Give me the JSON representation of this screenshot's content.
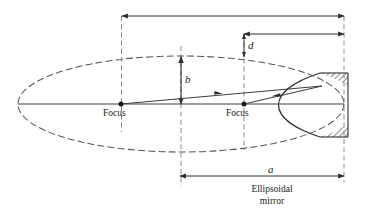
{
  "figure": {
    "type": "ray-diagram",
    "title": "",
    "caption_label": "Ellipsoidal\nmirror",
    "caption_line1": "Ellipsoidal",
    "caption_line2": "mirror",
    "labels": {
      "focus_left": "Focus",
      "focus_right": "Focus",
      "semi_minor": "b",
      "semi_major": "a",
      "distance_d": "d"
    },
    "colors": {
      "line": "#3c3c3c",
      "ellipse_dash": "#555555",
      "mirror_fill": "#b8b8b8",
      "mirror_border": "#333333",
      "text": "#1a1a1a",
      "background": "#ffffff"
    },
    "geometry": {
      "ellipse_center_x": 181,
      "ellipse_center_y": 104,
      "semi_major_px": 163,
      "semi_minor_px": 48,
      "focus_left_x": 121,
      "focus_right_x": 244,
      "axis_y": 104,
      "mirror_rect_x": 320,
      "mirror_rect_y": 73,
      "mirror_rect_w": 28,
      "mirror_rect_h": 64,
      "vertex_x": 322,
      "vertex_y": 86
    },
    "dimension_arrows": [
      {
        "name": "total-width",
        "x1": 122,
        "x2": 344,
        "y": 16,
        "orientation": "horizontal",
        "label": ""
      },
      {
        "name": "d-horizontal",
        "x1": 244,
        "x2": 344,
        "y": 34,
        "orientation": "horizontal",
        "label": ""
      },
      {
        "name": "d-vertical",
        "x": 244,
        "y1": 34,
        "y2": 56,
        "orientation": "vertical",
        "label": "d"
      },
      {
        "name": "b-vertical",
        "x": 181,
        "y1": 56,
        "y2": 104,
        "orientation": "vertical",
        "label": "b"
      },
      {
        "name": "a-horizontal",
        "x1": 180,
        "x2": 344,
        "y": 176,
        "orientation": "horizontal",
        "label": "a"
      }
    ],
    "rays": [
      {
        "name": "incident-ray",
        "from": "focus_left",
        "to": "mirror_vertex",
        "arrow_dir": "right"
      },
      {
        "name": "reflected-ray",
        "from": "mirror_vertex",
        "to": "focus_right",
        "arrow_dir": "left"
      }
    ]
  }
}
